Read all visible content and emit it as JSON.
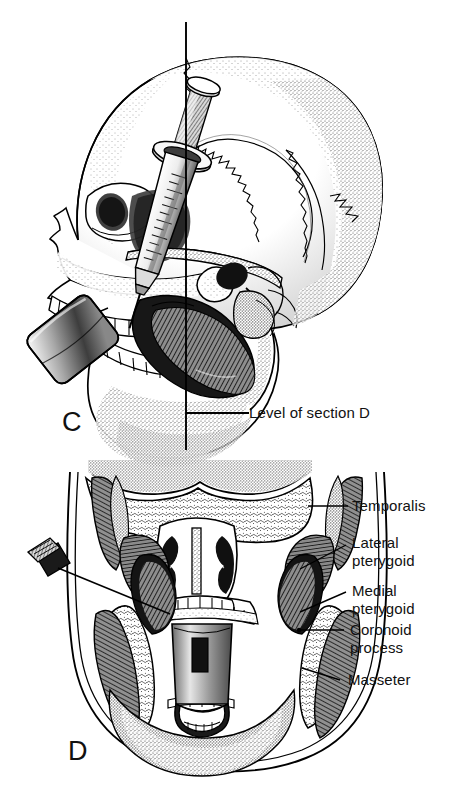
{
  "figure": {
    "background_color": "#ffffff",
    "ink_color": "#111111",
    "panels": [
      {
        "id": "C",
        "letter": "C",
        "view": "lateral skull with syringe and mouth prop",
        "annotations": [
          {
            "name": "level-of-section",
            "text": "Level of section D"
          }
        ],
        "structures": [
          "cranial vault",
          "frontal bone",
          "orbit",
          "zygomatic arch",
          "maxilla with teeth",
          "mandible with teeth",
          "masseter muscle",
          "external acoustic meatus",
          "mastoid process",
          "coronal suture",
          "lambdoid suture",
          "squamous suture",
          "syringe barrel",
          "syringe plunger",
          "syringe needle",
          "mouth prop"
        ]
      },
      {
        "id": "D",
        "letter": "D",
        "view": "coronal section through the head at the level indicated in C",
        "structures": [
          "cranial base",
          "nasal cavity and septum",
          "nasal conchae",
          "hard palate",
          "maxillary teeth",
          "mandibular teeth",
          "mandibular ramus",
          "mouth prop",
          "injection needle",
          "needle hub"
        ]
      }
    ]
  },
  "labels": {
    "section_level": "Level of section D",
    "panel_c": "C",
    "panel_d": "D",
    "items": [
      {
        "id": "temporalis",
        "text": "Temporalis",
        "lines": [
          "Temporalis"
        ]
      },
      {
        "id": "lateral-pterygoid",
        "text": "Lateral pterygoid",
        "lines": [
          "Lateral",
          "pterygoid"
        ]
      },
      {
        "id": "medial-pterygoid",
        "text": "Medial pterygoid",
        "lines": [
          "Medial",
          "pterygoid"
        ]
      },
      {
        "id": "coronoid-process",
        "text": "Coronoid process",
        "lines": [
          "Coronoid",
          "process"
        ]
      },
      {
        "id": "masseter",
        "text": "Masseter",
        "lines": [
          "Masseter"
        ]
      }
    ]
  },
  "colors": {
    "ink": "#111111",
    "line": "#000000",
    "muscle_dark": "#1c1c1c",
    "muscle_mid": "#555555",
    "bone_light": "#f2f2f2",
    "background": "#ffffff"
  }
}
